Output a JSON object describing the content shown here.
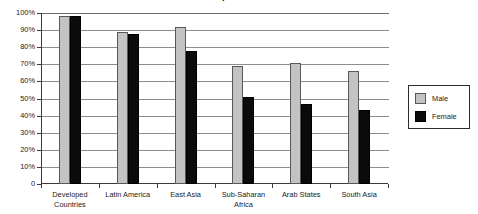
{
  "chart_data": {
    "type": "bar",
    "title": "",
    "xlabel": "",
    "ylabel": "",
    "ylim": [
      0,
      100
    ],
    "grid": true,
    "legend_position": "right",
    "categories": [
      "Developed\nCountries",
      "Latin America",
      "East Asia",
      "Sub-Saharan\nAfrica",
      "Arab States",
      "South Asia"
    ],
    "series": [
      {
        "name": "Male",
        "color": "#c3c3c3",
        "values": [
          98,
          89,
          92,
          69,
          71,
          66
        ]
      },
      {
        "name": "Female",
        "color": "#0b0b0b",
        "values": [
          98,
          88,
          78,
          51,
          47,
          43
        ]
      }
    ],
    "y_ticks": [
      "100%",
      "90%",
      "80%",
      "70%",
      "60%",
      "50%",
      "40%",
      "30%",
      "20%",
      "10%",
      "0"
    ],
    "y_tick_values": [
      100,
      90,
      80,
      70,
      60,
      50,
      40,
      30,
      20,
      10,
      0
    ]
  },
  "legend": {
    "items": [
      {
        "label": "Male"
      },
      {
        "label": "Female"
      }
    ]
  },
  "title_remnant": "."
}
